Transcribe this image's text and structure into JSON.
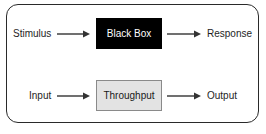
{
  "diagram": {
    "type": "process-flow",
    "rows": [
      {
        "input_label": "Stimulus",
        "box_label": "Black Box",
        "box_style": "black",
        "output_label": "Response"
      },
      {
        "input_label": "Input",
        "box_label": "Throughput",
        "box_style": "light-gray",
        "output_label": "Output"
      }
    ],
    "colors": {
      "frame_border": "#2a2a2a",
      "black_box_fill": "#000000",
      "black_box_text": "#ffffff",
      "throughput_fill": "#e3e3e3",
      "throughput_border": "#8a8a8a",
      "arrow": "#333333"
    },
    "icons": {
      "arrow": "right-arrow-icon"
    }
  }
}
